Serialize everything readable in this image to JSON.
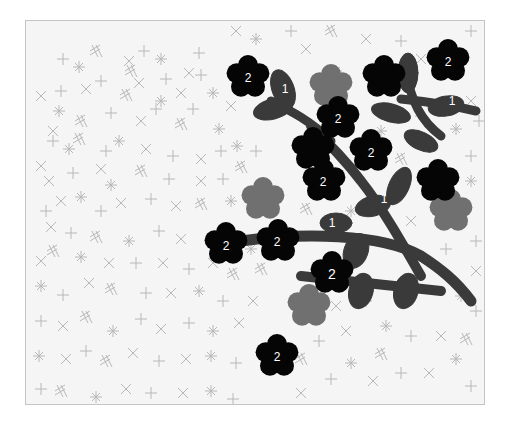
{
  "illustration": {
    "type": "paint-by-number",
    "subject": "flowering branch",
    "background_pattern": "scattered crosses and asterisks",
    "colors": {
      "page": "#ffffff",
      "paper": "#f5f5f5",
      "frame_border": "#c4c4c4",
      "pattern_marks": "#b8b8b8",
      "region_1_branch": "#3a3a3a",
      "region_2_flower": "#050505",
      "gray_flower": "#707070",
      "number_text": "#ffffff"
    },
    "legend_numbers": [
      "1",
      "2"
    ],
    "labels": {
      "flower_top_left": "2",
      "flower_top_right": "2",
      "flower_mid_upper": "2",
      "flower_center_right": "2",
      "flower_center_left": "2",
      "flower_left_a": "2",
      "flower_left_b": "2",
      "flower_lower": "2",
      "flower_bottom": "2",
      "leaf_top": "1",
      "leaf_top_right": "1",
      "leaf_middle": "1",
      "branch_main": "1"
    }
  }
}
